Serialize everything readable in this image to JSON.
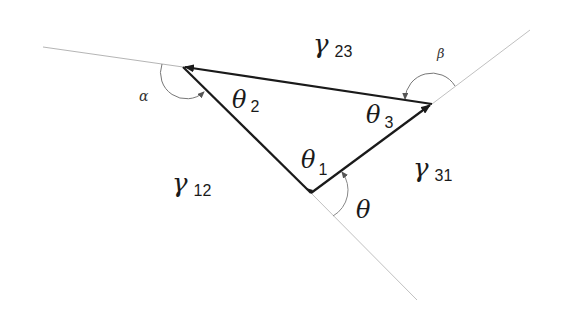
{
  "diagram": {
    "type": "triangle-angles",
    "colors": {
      "edge": "#1a1a1a",
      "extension": "#b0b0b0",
      "arc": "#777777"
    },
    "vertices": {
      "v2": {
        "x": 183,
        "y": 67,
        "angle_label": "θ",
        "angle_sub": "2"
      },
      "v3": {
        "x": 432,
        "y": 104,
        "angle_label": "θ",
        "angle_sub": "3"
      },
      "v1": {
        "x": 311,
        "y": 193,
        "angle_label": "θ",
        "angle_sub": "1"
      }
    },
    "regions": [
      {
        "id": "gamma23",
        "symbol": "γ",
        "sub": "23"
      },
      {
        "id": "gamma12",
        "symbol": "γ",
        "sub": "12"
      },
      {
        "id": "gamma31",
        "symbol": "γ",
        "sub": "31"
      }
    ],
    "exterior_angles": {
      "alpha": "α",
      "beta": "β",
      "theta": "θ"
    }
  }
}
